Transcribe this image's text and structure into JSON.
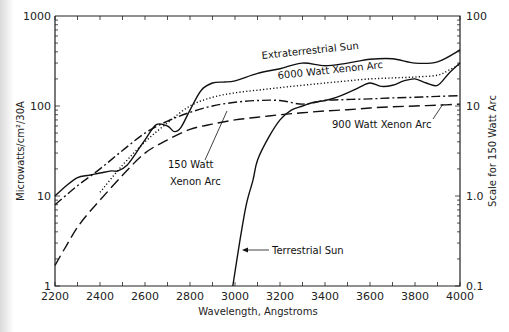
{
  "chart_data": {
    "type": "line",
    "title": "",
    "xlabel": "Wavelength, Angstroms",
    "ylabel": "Microwatts/cm²/30A",
    "y2label": "Scale for 150 Watt Arc",
    "xlim": [
      2200,
      4000
    ],
    "ylim": [
      1,
      1000
    ],
    "y2lim": [
      0.1,
      100
    ],
    "yscale": "log",
    "grid": false,
    "x_ticks": [
      "2200",
      "2400",
      "2600",
      "2800",
      "3000",
      "3200",
      "3400",
      "3600",
      "3800",
      "4000"
    ],
    "y_ticks": [
      "1",
      "10",
      "100",
      "1000"
    ],
    "y2_ticks": [
      "0.1",
      "1.0",
      "10",
      "100"
    ],
    "series": [
      {
        "name": "Extraterrestrial Sun",
        "style": "solid",
        "x": [
          2200,
          2250,
          2300,
          2350,
          2400,
          2450,
          2480,
          2520,
          2560,
          2600,
          2650,
          2700,
          2730,
          2760,
          2800,
          2850,
          2900,
          2950,
          3000,
          3100,
          3200,
          3300,
          3400,
          3500,
          3600,
          3700,
          3800,
          3900,
          4000
        ],
        "values": [
          10,
          13,
          16,
          17,
          18,
          19,
          19,
          22,
          30,
          42,
          62,
          60,
          52,
          58,
          90,
          150,
          180,
          185,
          190,
          230,
          260,
          300,
          280,
          300,
          330,
          335,
          300,
          310,
          420
        ]
      },
      {
        "name": "6000 Watt Xenon Arc",
        "style": "dotted",
        "x": [
          2400,
          2500,
          2600,
          2700,
          2800,
          2900,
          3000,
          3100,
          3200,
          3300,
          3400,
          3500,
          3600,
          3700,
          3800,
          3900,
          3950,
          4000
        ],
        "values": [
          11,
          22,
          40,
          65,
          100,
          125,
          140,
          150,
          160,
          170,
          180,
          190,
          200,
          205,
          210,
          220,
          250,
          290
        ]
      },
      {
        "name": "150 Watt Xenon Arc",
        "style": "dash-dot",
        "x": [
          2200,
          2300,
          2400,
          2500,
          2600,
          2700,
          2800,
          2900,
          3000,
          3100,
          3200,
          3300,
          3400,
          3500,
          3600,
          3700,
          3800,
          3900,
          4000
        ],
        "values": [
          8,
          13,
          20,
          32,
          50,
          68,
          85,
          100,
          110,
          115,
          115,
          105,
          115,
          118,
          120,
          123,
          125,
          128,
          130
        ]
      },
      {
        "name": "900 Watt Xenon Arc",
        "style": "long-dash",
        "x": [
          2200,
          2250,
          2300,
          2350,
          2400,
          2500,
          2600,
          2700,
          2800,
          2900,
          3000,
          3100,
          3200,
          3300,
          3400,
          3500,
          3600,
          3700,
          3800,
          3900,
          4000
        ],
        "values": [
          1.7,
          2.8,
          4.5,
          6.5,
          9,
          17,
          30,
          42,
          55,
          63,
          70,
          75,
          80,
          84,
          88,
          91,
          95,
          98,
          100,
          102,
          105
        ]
      },
      {
        "name": "Terrestrial Sun",
        "style": "solid",
        "x": [
          2990,
          3020,
          3050,
          3080,
          3100,
          3150,
          3200,
          3250,
          3300,
          3350,
          3400,
          3450,
          3500,
          3550,
          3600,
          3650,
          3700,
          3750,
          3800,
          3850,
          3900,
          3950,
          4000
        ],
        "values": [
          1,
          3,
          8,
          15,
          25,
          45,
          70,
          90,
          100,
          110,
          115,
          125,
          140,
          160,
          180,
          165,
          170,
          190,
          200,
          180,
          170,
          230,
          300
        ]
      }
    ],
    "annotations": [
      {
        "text": "Extraterrestrial Sun",
        "target": "Extraterrestrial Sun"
      },
      {
        "text": "6000 Watt Xenon Arc",
        "target": "6000 Watt Xenon Arc"
      },
      {
        "text": "150 Watt",
        "target": "150 Watt Xenon Arc"
      },
      {
        "text": "Xenon Arc",
        "target": "150 Watt Xenon Arc"
      },
      {
        "text": "900 Watt Xenon Arc",
        "target": "900 Watt Xenon Arc"
      },
      {
        "text": "Terrestrial Sun",
        "target": "Terrestrial Sun"
      }
    ]
  },
  "labels": {
    "ext_sun": "Extraterrestrial Sun",
    "xenon_6000": "6000 Watt Xenon Arc",
    "xenon_150_l1": "150 Watt",
    "xenon_150_l2": "Xenon Arc",
    "xenon_900": "900 Watt Xenon Arc",
    "terr_sun": "Terrestrial Sun"
  }
}
